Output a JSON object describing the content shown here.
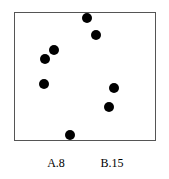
{
  "diagram": {
    "frame": {
      "left": 14,
      "top": 12,
      "right": 155,
      "bottom": 140,
      "border_color": "#555555"
    },
    "dot_color": "#000000",
    "dots": [
      {
        "x": 87,
        "y": 18
      },
      {
        "x": 96,
        "y": 35
      },
      {
        "x": 54,
        "y": 50
      },
      {
        "x": 45,
        "y": 59
      },
      {
        "x": 44,
        "y": 84
      },
      {
        "x": 114,
        "y": 88
      },
      {
        "x": 109,
        "y": 107
      },
      {
        "x": 70,
        "y": 135
      }
    ],
    "dot_count": 8
  },
  "options": [
    {
      "label": "A.8",
      "x": 56
    },
    {
      "label": "B.15",
      "x": 112
    }
  ]
}
